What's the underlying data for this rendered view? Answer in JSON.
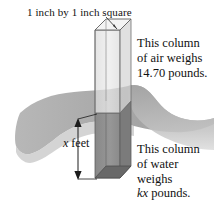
{
  "figure": {
    "kind": "physics-diagram",
    "background_color": "#ffffff",
    "ink_color": "#111111"
  },
  "callouts": {
    "top_square_label": "1 inch by 1 inch square",
    "air_column": {
      "line1": "This column",
      "line2": "of air weighs",
      "line3": "14.70 pounds."
    },
    "water_column": {
      "line1": "This column",
      "line2": "of water",
      "line3": "weighs",
      "line4_math": "kx",
      "line4_rest": " pounds."
    }
  },
  "dimension": {
    "depth_symbol": "x",
    "depth_unit": " feet"
  },
  "values": {
    "air_weight_pounds": "14.70",
    "cross_section_inches": "1 inch by 1 inch",
    "water_weight_expression": "kx pounds"
  },
  "colors": {
    "water_surface_light": "#b9b9b9",
    "water_surface_mid": "#a8a8a8",
    "water_surface_dark": "#9a9a9a",
    "column_above_water": "#e2e2e2",
    "column_below_water": "#8b8b8b",
    "column_below_water_dark": "#6f6f6f",
    "column_top_face": "#f2f2f2",
    "outline": "#555555"
  }
}
